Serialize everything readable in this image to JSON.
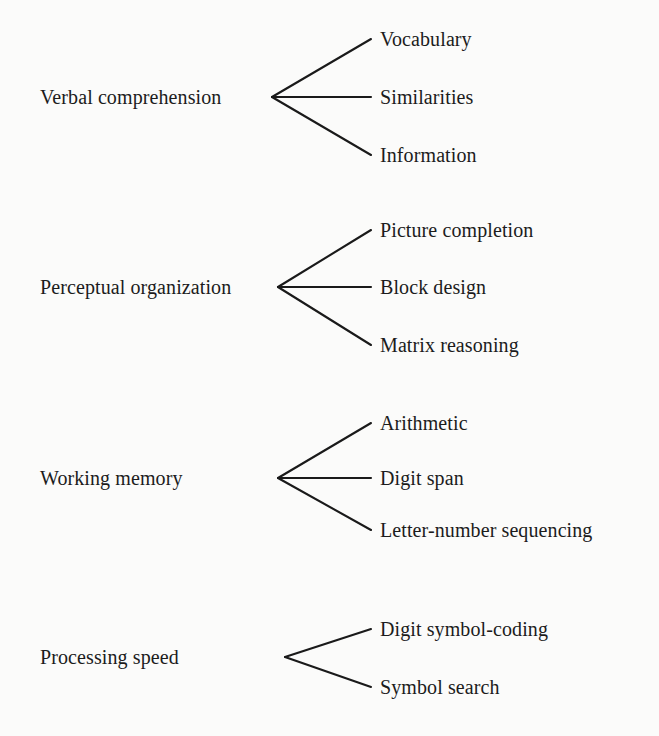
{
  "diagram": {
    "type": "tree",
    "orientation": "left-to-right",
    "background_color": "#fbfbfa",
    "line_color": "#1a1a1a",
    "text_color": "#1c1c1c",
    "groups": [
      {
        "factor": "Verbal comprehension",
        "factor_x": 40,
        "factor_y": 97,
        "vertex_x": 272,
        "vertex_y": 97,
        "branch_end_x": 371,
        "subtests": [
          {
            "label": "Vocabulary",
            "x": 380,
            "y": 39
          },
          {
            "label": "Similarities",
            "x": 380,
            "y": 97
          },
          {
            "label": "Information",
            "x": 380,
            "y": 155
          }
        ]
      },
      {
        "factor": "Perceptual organization",
        "factor_x": 40,
        "factor_y": 287,
        "vertex_x": 278,
        "vertex_y": 287,
        "branch_end_x": 371,
        "subtests": [
          {
            "label": "Picture completion",
            "x": 380,
            "y": 230
          },
          {
            "label": "Block design",
            "x": 380,
            "y": 287
          },
          {
            "label": "Matrix reasoning",
            "x": 380,
            "y": 345
          }
        ]
      },
      {
        "factor": "Working memory",
        "factor_x": 40,
        "factor_y": 478,
        "vertex_x": 278,
        "vertex_y": 478,
        "branch_end_x": 371,
        "subtests": [
          {
            "label": "Arithmetic",
            "x": 380,
            "y": 423
          },
          {
            "label": "Digit span",
            "x": 380,
            "y": 478
          },
          {
            "label": "Letter-number sequencing",
            "x": 380,
            "y": 530
          }
        ]
      },
      {
        "factor": "Processing speed",
        "factor_x": 40,
        "factor_y": 657,
        "vertex_x": 285,
        "vertex_y": 657,
        "branch_end_x": 371,
        "subtests": [
          {
            "label": "Digit symbol-coding",
            "x": 380,
            "y": 629
          },
          {
            "label": "Symbol search",
            "x": 380,
            "y": 687
          }
        ]
      }
    ]
  }
}
